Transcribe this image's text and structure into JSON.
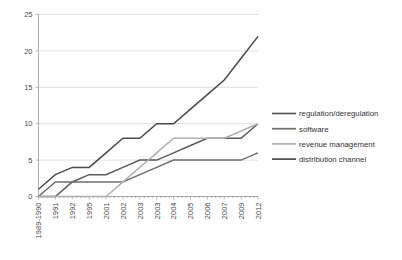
{
  "chart_data": {
    "type": "line",
    "title": "",
    "xlabel": "",
    "ylabel": "",
    "grid": true,
    "legend_position": "right",
    "ylim": [
      0,
      25
    ],
    "yticks": [
      0,
      5,
      10,
      15,
      20,
      25
    ],
    "categories": [
      "1989-1990",
      "1991",
      "1992",
      "1995",
      "2001",
      "2002",
      "2003",
      "2003",
      "2004",
      "2005",
      "2006",
      "2007",
      "2009",
      "2012"
    ],
    "series": [
      {
        "name": "regulation/deregulation",
        "color": "#5a5a5a",
        "values": [
          0,
          0,
          2,
          3,
          3,
          4,
          5,
          5,
          6,
          7,
          8,
          8,
          8,
          10
        ]
      },
      {
        "name": "software",
        "color": "#6e6e6e",
        "values": [
          0,
          2,
          2,
          2,
          2,
          2,
          3,
          4,
          5,
          5,
          5,
          5,
          5,
          6
        ]
      },
      {
        "name": "revenue management",
        "color": "#b0b0b0",
        "values": [
          0,
          0,
          0,
          0,
          0,
          2,
          4,
          6,
          8,
          8,
          8,
          8,
          9,
          10
        ]
      },
      {
        "name": "distribution channel",
        "color": "#4a4a4a",
        "values": [
          1,
          3,
          4,
          4,
          6,
          8,
          8,
          10,
          10,
          12,
          14,
          16,
          19,
          22
        ]
      }
    ]
  },
  "legend": {
    "items": [
      {
        "label": "regulation/deregulation",
        "color": "#5a5a5a"
      },
      {
        "label": "software",
        "color": "#6e6e6e"
      },
      {
        "label": "revenue management",
        "color": "#b0b0b0"
      },
      {
        "label": "distribution channel",
        "color": "#4a4a4a"
      }
    ]
  },
  "axes": {
    "y_labels": [
      "0",
      "5",
      "10",
      "15",
      "20",
      "25"
    ],
    "x_labels": [
      "1989-1990",
      "1991",
      "1992",
      "1995",
      "2001",
      "2002",
      "2003",
      "2003",
      "2004",
      "2005",
      "2006",
      "2007",
      "2009",
      "2012"
    ]
  }
}
